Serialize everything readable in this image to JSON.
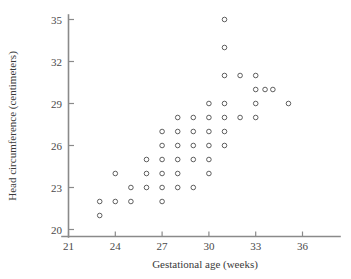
{
  "chart_data": {
    "type": "scatter",
    "title": "",
    "xlabel": "Gestational age (weeks)",
    "ylabel": "Head circumference (centimeters)",
    "xlim": [
      20.2,
      37.4
    ],
    "ylim": [
      19.4,
      35.6
    ],
    "xticks": [
      21,
      24,
      27,
      30,
      33,
      36
    ],
    "xticklabels": [
      "21",
      "24",
      "27",
      "30",
      "33",
      "36"
    ],
    "yticks": [
      20,
      23,
      26,
      29,
      32,
      35
    ],
    "yticklabels": [
      "20",
      "23",
      "26",
      "29",
      "32",
      "35"
    ],
    "grid": false,
    "legend": null,
    "marker": "open-circle",
    "marker_color": "#4d4d4d",
    "points": [
      [
        23.0,
        21.0
      ],
      [
        23.0,
        22.0
      ],
      [
        24.0,
        22.0
      ],
      [
        24.0,
        24.0
      ],
      [
        25.0,
        22.0
      ],
      [
        25.0,
        23.0
      ],
      [
        26.0,
        23.0
      ],
      [
        26.0,
        24.0
      ],
      [
        26.0,
        25.0
      ],
      [
        27.0,
        22.0
      ],
      [
        27.0,
        23.0
      ],
      [
        27.0,
        24.0
      ],
      [
        27.0,
        25.0
      ],
      [
        27.0,
        26.0
      ],
      [
        27.0,
        27.0
      ],
      [
        28.0,
        23.0
      ],
      [
        28.0,
        24.0
      ],
      [
        28.0,
        25.0
      ],
      [
        28.0,
        26.0
      ],
      [
        28.0,
        27.0
      ],
      [
        28.0,
        28.0
      ],
      [
        29.0,
        23.0
      ],
      [
        29.0,
        25.0
      ],
      [
        29.0,
        26.0
      ],
      [
        29.0,
        27.0
      ],
      [
        29.0,
        28.0
      ],
      [
        30.0,
        24.0
      ],
      [
        30.0,
        25.0
      ],
      [
        30.0,
        26.0
      ],
      [
        30.0,
        27.0
      ],
      [
        30.0,
        28.0
      ],
      [
        30.0,
        29.0
      ],
      [
        31.0,
        26.0
      ],
      [
        31.0,
        27.0
      ],
      [
        31.0,
        28.0
      ],
      [
        31.0,
        29.0
      ],
      [
        31.0,
        31.0
      ],
      [
        31.0,
        33.0
      ],
      [
        31.0,
        35.0
      ],
      [
        32.0,
        28.0
      ],
      [
        32.0,
        31.0
      ],
      [
        33.0,
        28.0
      ],
      [
        33.0,
        29.0
      ],
      [
        33.0,
        30.0
      ],
      [
        33.0,
        31.0
      ],
      [
        33.6,
        30.0
      ],
      [
        34.1,
        30.0
      ],
      [
        35.1,
        29.0
      ]
    ]
  },
  "axes": {
    "x_title": "Gestational age (weeks)",
    "y_title": "Head circumference (centimeters)"
  }
}
